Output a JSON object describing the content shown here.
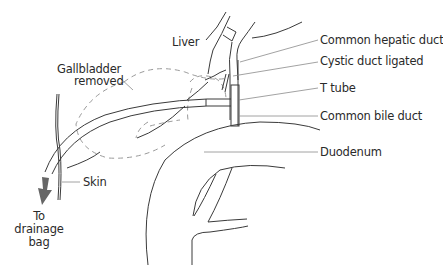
{
  "diagram": {
    "labels": {
      "liver": "Liver",
      "gallbladder_line1": "Gallbladder",
      "gallbladder_line2": "removed",
      "common_hepatic_duct": "Common hepatic duct",
      "cystic_duct": "Cystic duct ligated",
      "t_tube": "T tube",
      "common_bile_duct": "Common bile duct",
      "duodenum": "Duodenum",
      "skin": "Skin",
      "drainage_line1": "To",
      "drainage_line2": "drainage",
      "drainage_line3": "bag"
    },
    "colors": {
      "line": "#3a3a3a",
      "leader": "#8a8a8a",
      "dashed": "#9a9a9a",
      "arrow": "#666666"
    }
  }
}
